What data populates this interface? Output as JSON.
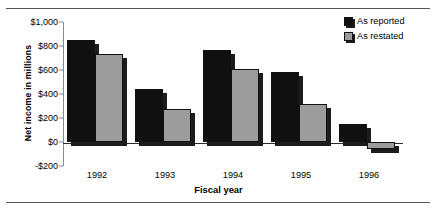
{
  "chart_data": {
    "type": "bar",
    "title": "",
    "xlabel": "Fiscal year",
    "ylabel": "Net income in millions",
    "categories": [
      "1992",
      "1993",
      "1994",
      "1995",
      "1996"
    ],
    "series": [
      {
        "name": "As reported",
        "color": "#101010",
        "values": [
          850,
          445,
          770,
          580,
          150
        ]
      },
      {
        "name": "As restated",
        "color": "#9c9c9c",
        "values": [
          735,
          275,
          605,
          315,
          -60
        ]
      }
    ],
    "ylim": [
      -200,
      1000
    ],
    "yticks": [
      1000,
      800,
      600,
      400,
      200,
      0,
      -200
    ],
    "ytick_labels": [
      "$1,000",
      "$800",
      "$600",
      "$400",
      "$200",
      "$0",
      "-$200"
    ],
    "grid": false,
    "legend_position": "top-right"
  }
}
